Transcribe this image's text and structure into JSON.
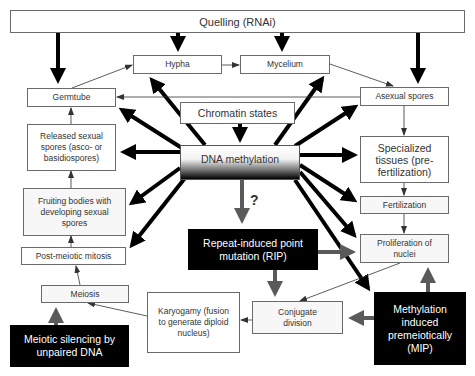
{
  "diagram": {
    "nodes": {
      "quelling": "Quelling (RNAi)",
      "hypha": "Hypha",
      "mycelium": "Mycelium",
      "germtube": "Germtube",
      "asexual_spores": "Asexual spores",
      "chromatin_states": "Chromatin states",
      "released_sexual_spores": "Released sexual spores (asco- or basidiospores)",
      "dna_methylation": "DNA methylation",
      "specialized_tissues": "Specialized tissues (pre-fertilization)",
      "fertilization": "Fertilization",
      "fruiting_bodies": "Fruiting bodies with developing sexual spores",
      "rip": "Repeat-induced point mutation (RIP)",
      "proliferation": "Proliferation of nuclei",
      "post_meiotic_mitosis": "Post-meiotic mitosis",
      "meiosis": "Meiosis",
      "karyogamy": "Karyogamy (fusion to generate diploid nucleus)",
      "conjugate_division": "Conjugate division",
      "meiotic_silencing": "Meiotic silencing by unpaired DNA",
      "mip": "Methylation induced premeiotically (MIP)"
    },
    "annotations": {
      "question_mark": "?"
    },
    "colors": {
      "thick_arrow": "#000000",
      "grey_arrow": "#5a5a5a",
      "thin_arrow": "#333333",
      "dark_box": "#000000"
    }
  }
}
